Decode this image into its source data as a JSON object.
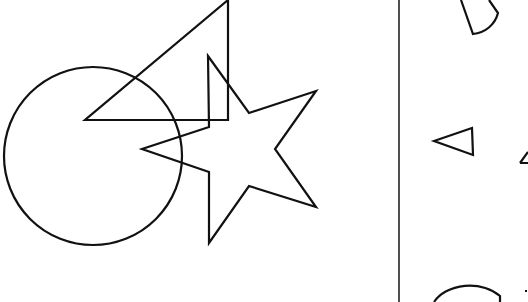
{
  "canvas": {
    "width": 528,
    "height": 302,
    "background": "#ffffff",
    "stroke": "#111111"
  },
  "left_panel": {
    "shapes": [
      {
        "name": "circle",
        "type": "circle",
        "cx": 93,
        "cy": 156,
        "r": 89
      },
      {
        "name": "right-triangle",
        "type": "polygon",
        "points": "228,0 228,120 85,120"
      },
      {
        "name": "star",
        "type": "polygon",
        "points": "208,56 249,113 316,91 275,149 316,207 249,186 209,243 209,172 142,149 209,127"
      }
    ]
  },
  "divider": {
    "x": 399,
    "y1": 0,
    "y2": 302
  },
  "right_panel": {
    "shapes": [
      {
        "name": "sector-top",
        "type": "path",
        "d": "M 461,0 L 473,34 A 28 28 0 0 0 498,13 L 489,0"
      },
      {
        "name": "small-triangle",
        "type": "polygon",
        "points": "434,141 472,128 473,155"
      },
      {
        "name": "partial-triangle-right",
        "type": "path",
        "d": "M 520,163 L 528,152 M 520,163 L 528,163"
      },
      {
        "name": "arc-bottom",
        "type": "path",
        "d": "M 434,302 A 40 30 0 0 1 500,296 L 500,302"
      },
      {
        "name": "dot-bottom-right",
        "type": "path",
        "d": "M 525,291 L 527,291"
      }
    ]
  }
}
